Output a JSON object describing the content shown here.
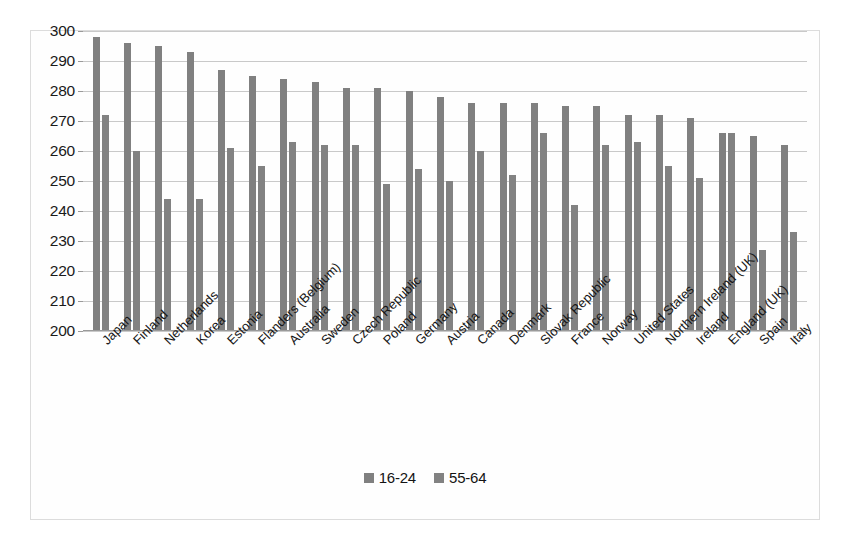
{
  "chart_data": {
    "type": "bar",
    "title": "",
    "subtitle": "",
    "xlabel": "",
    "ylabel": "",
    "ylim": [
      200,
      300
    ],
    "ytick_step": 10,
    "yticks": [
      300,
      290,
      280,
      270,
      260,
      250,
      240,
      230,
      220,
      210,
      200
    ],
    "grid": true,
    "legend_position": "bottom",
    "colors": {
      "series_16_24": "#808080",
      "series_55_64": "#828282",
      "gridline": "#c9c9c9",
      "border": "#dcdcdc",
      "text": "#161616"
    },
    "categories": [
      "Japan",
      "Finland",
      "Netherlands",
      "Korea",
      "Estonia",
      "Flanders (Belgium)",
      "Australia",
      "Sweden",
      "Czech Republic",
      "Poland",
      "Germany",
      "Austria",
      "Canada",
      "Denmark",
      "Slovak Republic",
      "France",
      "Norway",
      "United States",
      "Northern Ireland (UK)",
      "Ireland",
      "England (UK)",
      "Spain",
      "Italy"
    ],
    "series": [
      {
        "name": "16-24",
        "color": "#808080",
        "values": [
          298,
          296,
          295,
          293,
          287,
          285,
          284,
          283,
          281,
          281,
          280,
          278,
          276,
          276,
          276,
          275,
          275,
          272,
          272,
          271,
          266,
          265,
          262
        ]
      },
      {
        "name": "55-64",
        "color": "#828282",
        "values": [
          272,
          260,
          244,
          244,
          261,
          255,
          263,
          262,
          262,
          249,
          254,
          250,
          260,
          252,
          266,
          242,
          262,
          263,
          255,
          251,
          266,
          227,
          233
        ]
      }
    ],
    "legend": [
      {
        "label": "16-24",
        "color": "#808080"
      },
      {
        "label": "55-64",
        "color": "#828282"
      }
    ]
  }
}
